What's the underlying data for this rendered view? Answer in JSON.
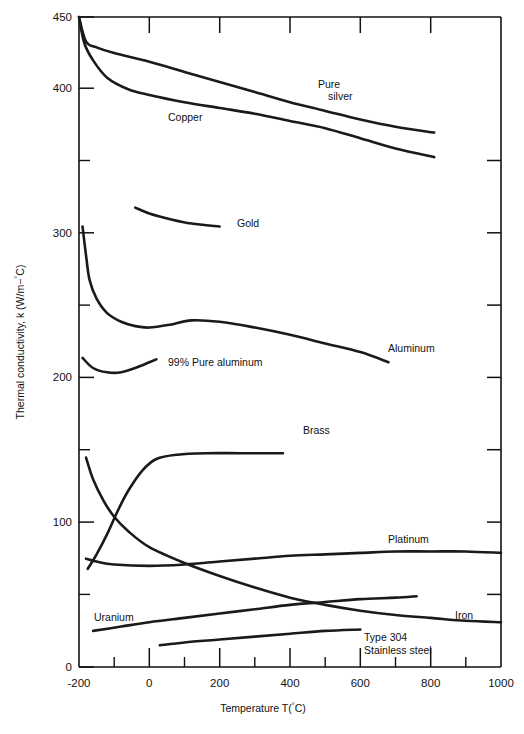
{
  "chart_data": {
    "type": "line",
    "title": "",
    "xlabel": "Temperature T(°C)",
    "ylabel": "Thermal conductivity, k (W/m−°C)",
    "xlim": [
      -200,
      1000
    ],
    "ylim": [
      0,
      450
    ],
    "xticks": [
      -200,
      0,
      200,
      400,
      600,
      800,
      1000
    ],
    "xtick_labels": [
      "-200",
      "0",
      "200",
      "400",
      "600",
      "800",
      "1000"
    ],
    "xticks_minor": [
      -100,
      100,
      300,
      500,
      700,
      900
    ],
    "yticks": [
      0,
      100,
      200,
      300,
      400,
      450
    ],
    "ytick_labels": [
      "0",
      "100",
      "200",
      "300",
      "400",
      "450"
    ],
    "yticks_minor": [
      50,
      150,
      250,
      350
    ],
    "grid": false,
    "legend": "inline-labels",
    "series": [
      {
        "name": "Pure silver",
        "label": "Pure silver",
        "label_lines": [
          "Pure",
          "silver"
        ],
        "points": [
          [
            -200,
            450
          ],
          [
            -180,
            433
          ],
          [
            -150,
            429
          ],
          [
            -100,
            425
          ],
          [
            0,
            419
          ],
          [
            100,
            412
          ],
          [
            200,
            405
          ],
          [
            300,
            398
          ],
          [
            400,
            391
          ],
          [
            500,
            385
          ],
          [
            600,
            379
          ],
          [
            700,
            374
          ],
          [
            810,
            370
          ]
        ]
      },
      {
        "name": "Copper",
        "label": "Copper",
        "points": [
          [
            -200,
            450
          ],
          [
            -185,
            432
          ],
          [
            -160,
            420
          ],
          [
            -120,
            408
          ],
          [
            -60,
            400
          ],
          [
            0,
            396
          ],
          [
            100,
            391
          ],
          [
            200,
            387
          ],
          [
            300,
            383
          ],
          [
            400,
            378
          ],
          [
            500,
            373
          ],
          [
            600,
            366
          ],
          [
            700,
            359
          ],
          [
            810,
            353
          ]
        ]
      },
      {
        "name": "Gold",
        "label": "Gold",
        "points": [
          [
            -40,
            318
          ],
          [
            0,
            314
          ],
          [
            60,
            310
          ],
          [
            120,
            307
          ],
          [
            200,
            305
          ]
        ]
      },
      {
        "name": "Aluminum",
        "label": "Aluminum",
        "points": [
          [
            -190,
            305
          ],
          [
            -180,
            285
          ],
          [
            -170,
            268
          ],
          [
            -150,
            255
          ],
          [
            -120,
            245
          ],
          [
            -80,
            239
          ],
          [
            -40,
            236
          ],
          [
            0,
            235
          ],
          [
            60,
            237
          ],
          [
            120,
            240
          ],
          [
            200,
            239
          ],
          [
            300,
            235
          ],
          [
            400,
            230
          ],
          [
            500,
            224
          ],
          [
            600,
            218
          ],
          [
            680,
            211
          ]
        ]
      },
      {
        "name": "99% Pure aluminum",
        "label": "99% Pure aluminum",
        "points": [
          [
            -190,
            214
          ],
          [
            -160,
            207
          ],
          [
            -120,
            204
          ],
          [
            -80,
            204
          ],
          [
            -40,
            207
          ],
          [
            0,
            211
          ],
          [
            20,
            213
          ]
        ]
      },
      {
        "name": "Brass",
        "label": "Brass",
        "points": [
          [
            -175,
            68
          ],
          [
            -150,
            78
          ],
          [
            -120,
            92
          ],
          [
            -90,
            108
          ],
          [
            -60,
            122
          ],
          [
            -20,
            136
          ],
          [
            20,
            144
          ],
          [
            80,
            147
          ],
          [
            160,
            148
          ],
          [
            260,
            148
          ],
          [
            380,
            148
          ]
        ]
      },
      {
        "name": "Platinum",
        "label": "Platinum",
        "points": [
          [
            -180,
            75
          ],
          [
            -150,
            73
          ],
          [
            -100,
            71
          ],
          [
            0,
            70
          ],
          [
            100,
            71
          ],
          [
            200,
            73
          ],
          [
            300,
            75
          ],
          [
            400,
            77
          ],
          [
            500,
            78
          ],
          [
            600,
            79
          ],
          [
            700,
            80
          ],
          [
            800,
            80
          ],
          [
            900,
            80
          ],
          [
            1000,
            79
          ]
        ]
      },
      {
        "name": "Iron",
        "label": "Iron",
        "points": [
          [
            -180,
            145
          ],
          [
            -160,
            130
          ],
          [
            -130,
            115
          ],
          [
            -100,
            104
          ],
          [
            -60,
            94
          ],
          [
            0,
            83
          ],
          [
            100,
            72
          ],
          [
            200,
            63
          ],
          [
            300,
            55
          ],
          [
            400,
            48
          ],
          [
            500,
            43
          ],
          [
            600,
            39
          ],
          [
            700,
            36
          ],
          [
            800,
            34
          ],
          [
            900,
            32
          ],
          [
            1000,
            31
          ]
        ]
      },
      {
        "name": "Uranium",
        "label": "Uranium",
        "points": [
          [
            -160,
            25
          ],
          [
            -80,
            28
          ],
          [
            0,
            31
          ],
          [
            100,
            34
          ],
          [
            200,
            37
          ],
          [
            300,
            40
          ],
          [
            400,
            43
          ],
          [
            500,
            45
          ],
          [
            600,
            47
          ],
          [
            700,
            48
          ],
          [
            760,
            49
          ]
        ]
      },
      {
        "name": "Type 304 Stainless steel",
        "label": "Type 304 Stainless steel",
        "label_lines": [
          "Type 304",
          "Stainless steel"
        ],
        "points": [
          [
            30,
            15
          ],
          [
            100,
            17
          ],
          [
            200,
            19
          ],
          [
            300,
            21
          ],
          [
            400,
            23
          ],
          [
            500,
            25
          ],
          [
            600,
            26
          ]
        ]
      }
    ]
  },
  "axes": {
    "x_title": "Temperature T(°C)",
    "y_title_prefix": "Thermal conductivity, k (W/m−",
    "y_title_sup": "°",
    "y_title_suffix": "C)"
  },
  "labels": {
    "pure_silver_line1": "Pure",
    "pure_silver_line2": "silver",
    "copper": "Copper",
    "gold": "Gold",
    "aluminum": "Aluminum",
    "pure_aluminum": "99% Pure aluminum",
    "brass": "Brass",
    "platinum": "Platinum",
    "iron": "Iron",
    "uranium": "Uranium",
    "stainless_line1": "Type 304",
    "stainless_line2": "Stainless steel"
  },
  "xtick_labels": {
    "t0": "-200",
    "t1": "0",
    "t2": "200",
    "t3": "400",
    "t4": "600",
    "t5": "800",
    "t6": "1000"
  },
  "ytick_labels": {
    "v0": "0",
    "v1": "100",
    "v2": "200",
    "v3": "300",
    "v4": "400",
    "v5": "450"
  },
  "colors": {
    "curve": "#1a1a18",
    "axis": "#111111",
    "background": "#ffffff"
  }
}
